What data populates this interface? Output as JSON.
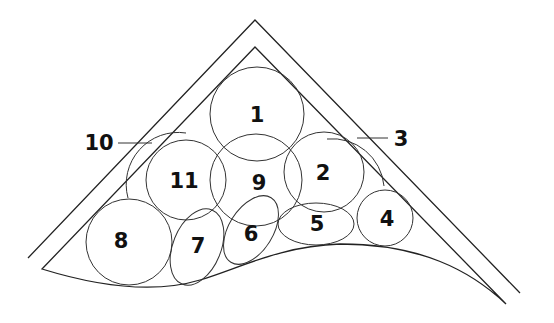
{
  "diagram": {
    "labels": {
      "c1": "1",
      "c2": "2",
      "c3": "3",
      "c4": "4",
      "c5": "5",
      "c6": "6",
      "c7": "7",
      "c8": "8",
      "c9": "9",
      "c10": "10",
      "c11": "11"
    },
    "colors": {
      "stroke": "#333333",
      "text": "#111111",
      "background": "#ffffff"
    }
  }
}
